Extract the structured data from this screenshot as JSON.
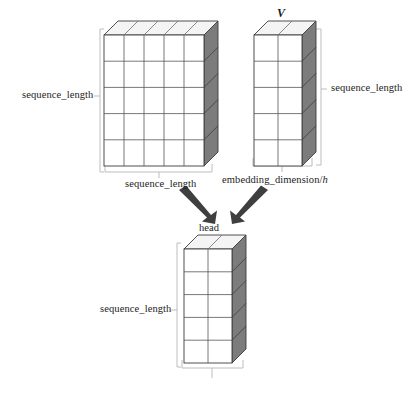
{
  "figure": {
    "title": "",
    "background_color": "#ffffff",
    "ink_color": "#1c1c1c"
  },
  "blocks": {
    "attention_matrix": {
      "name": "attention_matrix_block",
      "label_top": "",
      "label_left": "sequence_length",
      "label_bottom": "sequence_length",
      "columns": 5,
      "rows": 5,
      "face_color": "#ffffff",
      "side_color": "#7a7a7a",
      "top_color": "#f2f2f2",
      "edge_color": "#3c3c3c"
    },
    "value_matrix": {
      "name": "value_matrix_block",
      "label_top": "V",
      "label_right": "sequence_length",
      "label_bottom": "embedding_dimension/",
      "label_bottom_italic": "h",
      "columns": 2,
      "rows": 5,
      "face_color": "#ffffff",
      "side_color": "#7a7a7a",
      "top_color": "#f2f2f2",
      "edge_color": "#3c3c3c"
    },
    "head_output": {
      "name": "head_output_block",
      "label_top": "head",
      "label_left": "sequence_length",
      "label_bottom": "",
      "columns": 2,
      "rows": 5,
      "face_color": "#ffffff",
      "side_color": "#7a7a7a",
      "top_color": "#f2f2f2",
      "edge_color": "#3c3c3c"
    }
  },
  "arrows": {
    "color": "#3f3f3f",
    "left_arrow_name": "arrow-from-attention-to-head",
    "right_arrow_name": "arrow-from-value-to-head"
  },
  "brackets": {
    "color": "#b8b8b8"
  }
}
